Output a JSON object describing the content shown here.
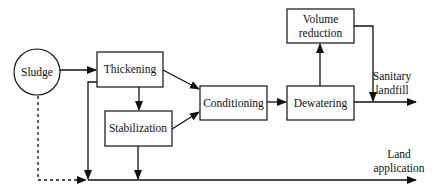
{
  "diagram": {
    "type": "flowchart",
    "nodes": {
      "sludge": {
        "label": "Sludge",
        "shape": "circle"
      },
      "thickening": {
        "label": "Thickening",
        "shape": "box"
      },
      "stabilization": {
        "label": "Stabilization",
        "shape": "box"
      },
      "conditioning": {
        "label": "Conditioning",
        "shape": "box"
      },
      "dewatering": {
        "label": "Dewatering",
        "shape": "box"
      },
      "volume_reduction": {
        "label_line1": "Volume",
        "label_line2": "reduction",
        "shape": "box"
      }
    },
    "outputs": {
      "sanitary_landfill": {
        "line1": "Sanitary",
        "line2": "landfill"
      },
      "land_application": {
        "line1": "Land",
        "line2": "application"
      }
    },
    "edges": [
      {
        "from": "Sludge",
        "to": "Thickening",
        "style": "solid"
      },
      {
        "from": "Thickening",
        "to": "Stabilization",
        "style": "solid"
      },
      {
        "from": "Thickening",
        "to": "Conditioning",
        "style": "solid"
      },
      {
        "from": "Stabilization",
        "to": "Conditioning",
        "style": "solid"
      },
      {
        "from": "Conditioning",
        "to": "Dewatering",
        "style": "solid"
      },
      {
        "from": "Dewatering",
        "to": "Volume reduction",
        "style": "solid"
      },
      {
        "from": "Dewatering",
        "to": "Sanitary landfill",
        "style": "solid"
      },
      {
        "from": "Volume reduction",
        "to": "Sanitary landfill",
        "style": "solid"
      },
      {
        "from": "Thickening",
        "to": "Land application",
        "style": "solid"
      },
      {
        "from": "Stabilization",
        "to": "Land application",
        "style": "solid"
      },
      {
        "from": "Sludge",
        "to": "Land application",
        "style": "dashed"
      }
    ]
  }
}
